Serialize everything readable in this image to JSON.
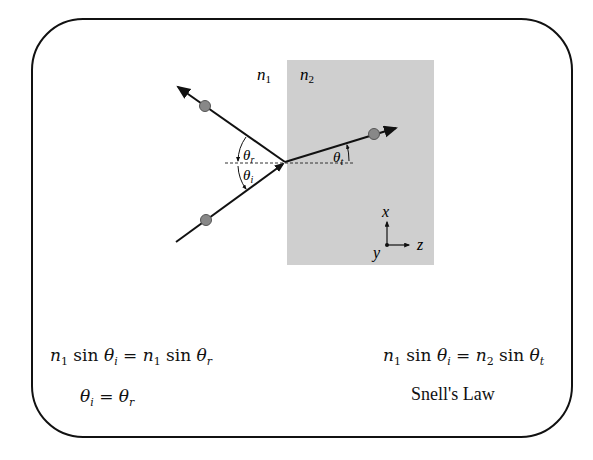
{
  "diagram": {
    "media": {
      "left_label": "n1",
      "right_label": "n2",
      "medium2_color": "#cfcfcf"
    },
    "angles": {
      "reflected": "θr",
      "incident": "θi",
      "transmitted": "θt"
    },
    "axes": {
      "x": "x",
      "y": "y",
      "z": "z"
    }
  },
  "equations": {
    "reflection_eq": {
      "lhs": "n1 sin θi",
      "rhs": "n1 sin θr"
    },
    "reflection_law": {
      "lhs": "θi",
      "rhs": "θr"
    },
    "snell_eq": {
      "lhs": "n1 sin θi",
      "rhs": "n2 sin θt"
    },
    "snell_caption": "Snell's Law"
  }
}
